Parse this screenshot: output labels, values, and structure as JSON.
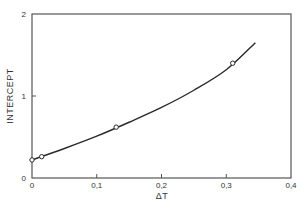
{
  "chart_data": {
    "type": "line",
    "title": "",
    "xlabel": "ΔT",
    "ylabel": "INTERCEPT",
    "xlim": [
      0,
      0.4
    ],
    "ylim": [
      0,
      2
    ],
    "x_ticks": [
      0,
      0.1,
      0.2,
      0.3,
      0.4
    ],
    "x_tick_labels": [
      "0",
      "0,1",
      "0,2",
      "0,3",
      "0,4"
    ],
    "y_ticks": [
      0,
      1,
      2
    ],
    "y_tick_labels": [
      "0",
      "1",
      "2"
    ],
    "grid": false,
    "legend": null,
    "series": [
      {
        "name": "measured points",
        "style": "open-circle markers",
        "x": [
          0.0,
          0.015,
          0.13,
          0.31
        ],
        "y": [
          0.22,
          0.26,
          0.62,
          1.4
        ]
      },
      {
        "name": "fitted curve",
        "style": "solid line",
        "x": [
          0.0,
          0.05,
          0.1,
          0.15,
          0.2,
          0.25,
          0.3,
          0.345
        ],
        "y": [
          0.22,
          0.36,
          0.51,
          0.68,
          0.86,
          1.07,
          1.32,
          1.65
        ]
      }
    ]
  },
  "labels": {
    "xlabel": "ΔT",
    "ylabel": "INTERCEPT",
    "x_ticks": [
      "0",
      "0,1",
      "0,2",
      "0,3",
      "0,4"
    ],
    "y_ticks": [
      "0",
      "1",
      "2"
    ]
  },
  "colors": {
    "line": "#2a2a2a",
    "frame": "#555555",
    "background": "#ffffff"
  }
}
